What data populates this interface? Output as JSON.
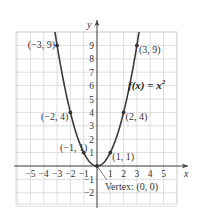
{
  "chart_data": {
    "type": "line",
    "title": "",
    "function_label": "f(x) = x²",
    "function_label_base": "f(x) = x",
    "function_label_exp": "2",
    "xlabel": "x",
    "ylabel": "y",
    "xlim": [
      -6,
      6
    ],
    "ylim": [
      -3,
      10
    ],
    "grid": true,
    "x_ticks": [
      -5,
      -4,
      -3,
      -2,
      -1,
      1,
      2,
      3,
      4,
      5
    ],
    "y_ticks": [
      -2,
      -1,
      1,
      2,
      3,
      4,
      5,
      6,
      7,
      8,
      9
    ],
    "x_tick_labels": [
      "−5",
      "−4",
      "−3",
      "−2",
      "−1",
      "1",
      "2",
      "3",
      "4",
      "5"
    ],
    "y_tick_labels": [
      "−2",
      "−1",
      "1",
      "2",
      "3",
      "4",
      "5",
      "6",
      "7",
      "8",
      "9"
    ],
    "series": [
      {
        "name": "f(x) = x^2",
        "x": [
          -3,
          -2,
          -1,
          0,
          1,
          2,
          3
        ],
        "y": [
          9,
          4,
          1,
          0,
          1,
          4,
          9
        ]
      }
    ],
    "points": [
      {
        "x": -3,
        "y": 9,
        "label": "(−3, 9)"
      },
      {
        "x": -2,
        "y": 4,
        "label": "(−2, 4)"
      },
      {
        "x": -1,
        "y": 1,
        "label": "(−1, 1)"
      },
      {
        "x": 0,
        "y": 0,
        "label": "Vertex: (0, 0)"
      },
      {
        "x": 1,
        "y": 1,
        "label": "(1, 1)"
      },
      {
        "x": 2,
        "y": 4,
        "label": "(2, 4)"
      },
      {
        "x": 3,
        "y": 9,
        "label": "(3, 9)"
      }
    ],
    "annotations": [
      "Vertex: (0, 0)"
    ],
    "colors": {
      "curve": "#3a3a3a",
      "grid": "#d6d6d6",
      "axis": "#444444",
      "point": "#333333"
    }
  }
}
